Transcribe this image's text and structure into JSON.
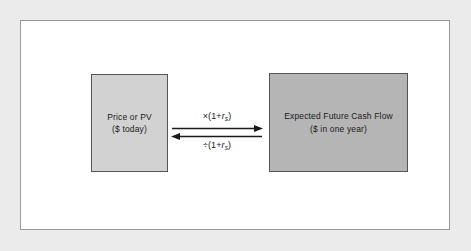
{
  "figure": {
    "background_color": "#ebebeb",
    "panel_color": "#ffffff",
    "panel_border_color": "#9a9a9a"
  },
  "boxes": [
    {
      "id": "price-or-pv",
      "line1": "Price or PV",
      "line2": "($ today)",
      "fill_color": "#d2d2d2",
      "border_color": "#555555"
    },
    {
      "id": "expected-future-cash-flow",
      "line1": "Expected Future Cash Flow",
      "line2": "($ in one year)",
      "fill_color": "#b5b5b5",
      "border_color": "#555555"
    }
  ],
  "arrows": {
    "forward": {
      "direction": "right",
      "operator": "×",
      "expression_prefix": "(1+",
      "variable": "r",
      "subscript": "s",
      "expression_suffix": ")",
      "color": "#1a1a1a"
    },
    "backward": {
      "direction": "left",
      "operator": "÷",
      "expression_prefix": "(1+",
      "variable": "r",
      "subscript": "s",
      "expression_suffix": ")",
      "color": "#1a1a1a"
    }
  }
}
